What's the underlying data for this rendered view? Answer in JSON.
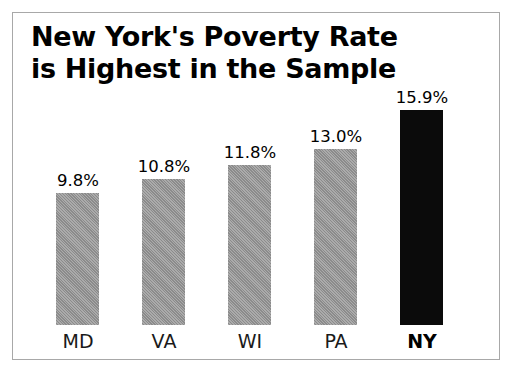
{
  "chart_data": {
    "type": "bar",
    "title": "New York's Poverty Rate\nis Highest in the Sample",
    "xlabel": "",
    "ylabel": "",
    "ylim": [
      0,
      15.9
    ],
    "grid": false,
    "legend": "none",
    "categories": [
      "MD",
      "VA",
      "WI",
      "PA",
      "NY"
    ],
    "values": [
      9.8,
      10.8,
      11.8,
      13.0,
      15.9
    ],
    "value_labels": [
      "9.8%",
      "10.8%",
      "11.8%",
      "13.0%",
      "15.9%"
    ],
    "bars": [
      {
        "category": "MD",
        "value": 9.8,
        "label": "9.8%",
        "color": "#9b9b9b",
        "highlight": false
      },
      {
        "category": "VA",
        "value": 10.8,
        "label": "10.8%",
        "color": "#9b9b9b",
        "highlight": false
      },
      {
        "category": "WI",
        "value": 11.8,
        "label": "11.8%",
        "color": "#9b9b9b",
        "highlight": false
      },
      {
        "category": "PA",
        "value": 13.0,
        "label": "13.0%",
        "color": "#9b9b9b",
        "highlight": false
      },
      {
        "category": "NY",
        "value": 15.9,
        "label": "15.9%",
        "color": "#0b0b0b",
        "highlight": true
      }
    ],
    "colors": {
      "bar_default": "#9b9b9b",
      "bar_highlight": "#0b0b0b",
      "border": "#a8a8a8",
      "background": "#ffffff",
      "text": "#000000"
    }
  }
}
